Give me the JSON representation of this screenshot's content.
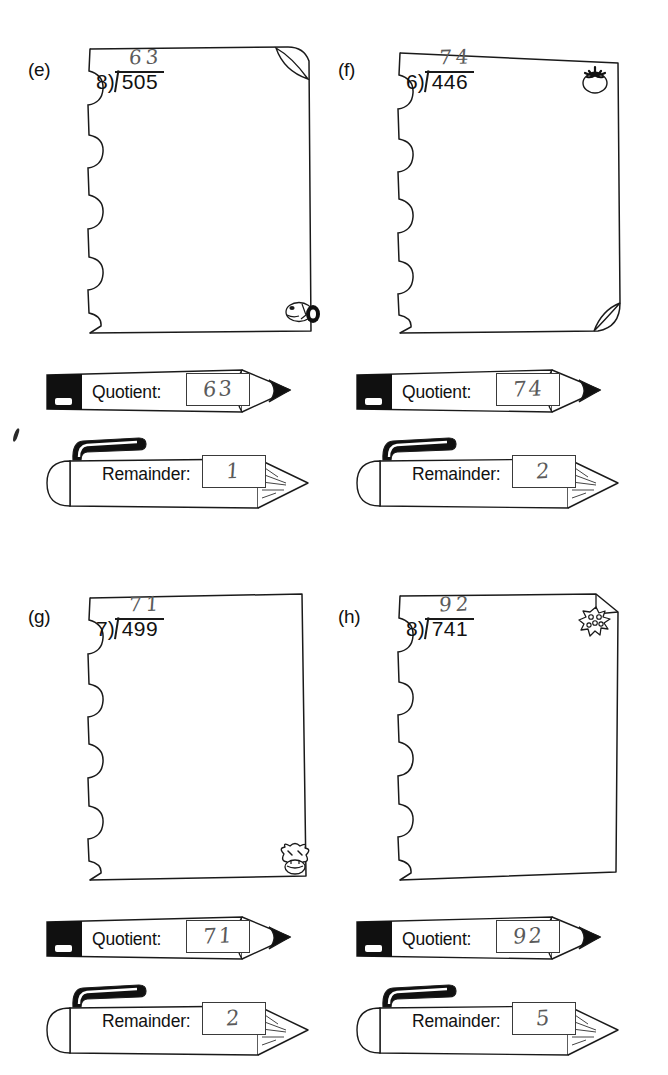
{
  "worksheet": {
    "title": "Long Division Practice — Quotient and Remainder",
    "quotient_label": "Quotient:",
    "remainder_label": "Remainder:",
    "stray_mark": "ink-mark"
  },
  "problems": [
    {
      "id": "e",
      "label": "(e)",
      "divisor": "8)",
      "dividend": "505",
      "handwritten_quotient": "63",
      "quotient_answer": "63",
      "remainder_answer": "1",
      "doodle": "dog-face-doodle",
      "doodle_position": "bottom-right",
      "curled_corner": "top-right"
    },
    {
      "id": "f",
      "label": "(f)",
      "divisor": "6)",
      "dividend": "446",
      "handwritten_quotient": "74",
      "quotient_answer": "74",
      "remainder_answer": "2",
      "doodle": "tomato-doodle",
      "doodle_position": "top-right",
      "curled_corner": "bottom-right"
    },
    {
      "id": "g",
      "label": "(g)",
      "divisor": "7)",
      "dividend": "499",
      "handwritten_quotient": "71",
      "quotient_answer": "71",
      "remainder_answer": "2",
      "doodle": "cow-face-doodle",
      "doodle_position": "bottom-right",
      "curled_corner": "none"
    },
    {
      "id": "h",
      "label": "(h)",
      "divisor": "8)",
      "dividend": "741",
      "handwritten_quotient": "92",
      "quotient_answer": "92",
      "remainder_answer": "5",
      "doodle": "berry-doodle",
      "doodle_position": "top-right",
      "curled_corner": "top-right"
    }
  ],
  "colors": {
    "ink": "#111111",
    "pencil_lead": "#5a5a5a",
    "paper": "#ffffff",
    "graphite_black": "#101010"
  }
}
